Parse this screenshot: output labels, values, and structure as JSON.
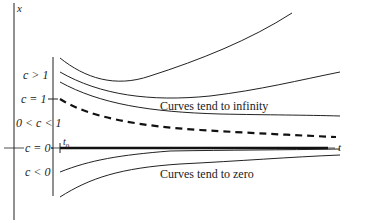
{
  "axes": {
    "vertical_label": "x",
    "horizontal_label": "t",
    "start_tick_label": "t0",
    "start_tick_main": "t",
    "start_tick_sub": "0"
  },
  "regions": [
    {
      "id": "c_gt_1",
      "label": "c > 1"
    },
    {
      "id": "c_eq_1",
      "label": "c = 1"
    },
    {
      "id": "c_between",
      "label": "0 < c < 1"
    },
    {
      "id": "c_eq_0",
      "label": "c = 0"
    },
    {
      "id": "c_lt_0",
      "label": "c < 0"
    }
  ],
  "annotations": {
    "upper": "Curves tend to infinity",
    "lower": "Curves tend to zero"
  },
  "colors": {
    "ink": "#222222",
    "background": "#ffffff"
  }
}
